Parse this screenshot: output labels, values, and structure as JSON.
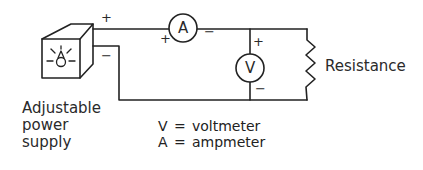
{
  "diagram": {
    "type": "circuit",
    "components": {
      "power_supply": {
        "label_lines": [
          "Adjustable",
          "power",
          "supply"
        ],
        "plus": "+",
        "minus": "−",
        "icon": "lightbulb-icon"
      },
      "ammeter": {
        "symbol": "A",
        "plus": "+",
        "minus": "−"
      },
      "voltmeter": {
        "symbol": "V",
        "plus": "+",
        "minus": "−"
      },
      "resistor": {
        "label": "Resistance"
      }
    },
    "legend": [
      {
        "symbol": "V",
        "eq": "=",
        "meaning": "voltmeter"
      },
      {
        "symbol": "A",
        "eq": "=",
        "meaning": "ampmeter"
      }
    ],
    "colors": {
      "line": "#222222",
      "background": "#ffffff"
    }
  }
}
